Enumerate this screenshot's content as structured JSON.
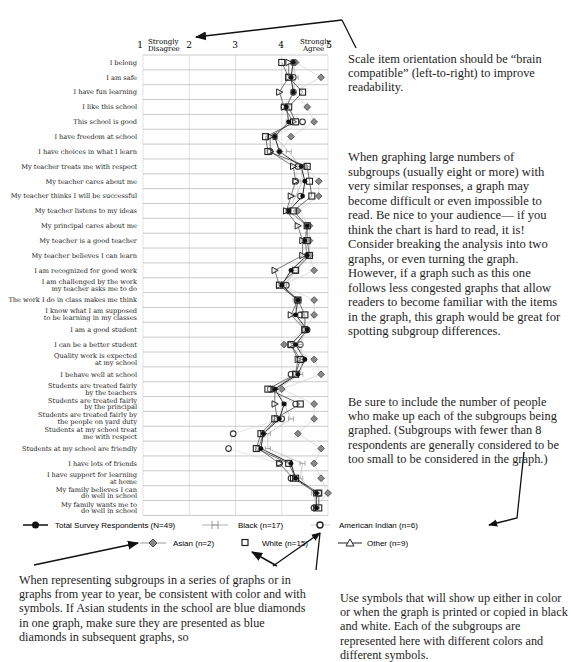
{
  "chart_data": {
    "type": "scatter",
    "title": "",
    "xlabel": "",
    "ylabel": "",
    "xlim": [
      1,
      5
    ],
    "x_ticks": [
      "1",
      "2",
      "3",
      "4",
      "5"
    ],
    "x_tick_annotations": {
      "1": "Strongly Disagree",
      "5": "Strongly Agree"
    },
    "grid": true,
    "legend_position": "bottom",
    "categories": [
      "I belong",
      "I am safe",
      "I have fun learning",
      "I like this school",
      "This school is good",
      "I have freedom at school",
      "I have choices in what I learn",
      "My teacher treats me with respect",
      "My teacher cares about me",
      "My teacher thinks I will be successful",
      "My teacher listens to my ideas",
      "My principal cares about me",
      "My teacher is a good teacher",
      "My teacher believes I can learn",
      "I am recognized for good work",
      "I am challenged by the work my teacher asks me to do",
      "The work I do in class makes me think",
      "I know what I am supposed to be learning in my classes",
      "I am a good student",
      "I can be a better student",
      "Quality work is expected at my school",
      "I behave well at school",
      "Students are treated fairly by the teachers",
      "Students are treated fairly by the principal",
      "Students are treated fairly by the people on yard duty",
      "Students at my school treat me with respect",
      "Students at my school are friendly",
      "I have lots of friends",
      "I have support for learning at home",
      "My family believes I can do well in school",
      "My family wants me to do well in school"
    ],
    "series": [
      {
        "name": "Total Survey Respondents (N=49)",
        "marker": "filled-circle",
        "line": true,
        "color": "#111111",
        "values": [
          4.25,
          4.2,
          4.25,
          4.1,
          4.15,
          3.85,
          3.95,
          4.42,
          4.5,
          4.45,
          4.15,
          4.55,
          4.5,
          4.55,
          4.2,
          4.0,
          4.35,
          4.3,
          4.55,
          4.3,
          4.5,
          4.35,
          3.85,
          4.05,
          3.95,
          3.6,
          3.55,
          4.2,
          4.3,
          4.75,
          4.75
        ]
      },
      {
        "name": "Black (n=17)",
        "marker": "bowtie",
        "line": true,
        "color": "#aaaaaa",
        "values": [
          4.25,
          4.3,
          4.25,
          4.1,
          4.15,
          3.85,
          4.15,
          4.4,
          4.45,
          4.3,
          4.15,
          4.55,
          4.5,
          4.55,
          4.3,
          4.05,
          4.3,
          4.3,
          4.5,
          4.4,
          4.45,
          4.4,
          3.9,
          4.05,
          4.2,
          3.7,
          3.7,
          4.45,
          4.4,
          4.7,
          4.75
        ]
      },
      {
        "name": "American Indian (n=6)",
        "marker": "open-circle",
        "line": true,
        "color": "#333333",
        "values": [
          4.25,
          4.25,
          4.25,
          4.05,
          4.45,
          3.85,
          3.75,
          4.35,
          4.3,
          4.4,
          4.15,
          4.55,
          4.5,
          4.55,
          4.3,
          4.1,
          4.35,
          4.4,
          4.55,
          4.4,
          4.45,
          4.2,
          3.75,
          4.3,
          4.0,
          2.95,
          2.85,
          3.95,
          4.2,
          4.8,
          4.7
        ]
      },
      {
        "name": "Asian (n=2)",
        "marker": "diamond",
        "line": true,
        "color": "#888888",
        "values": [
          4.3,
          4.85,
          4.25,
          4.55,
          4.7,
          4.2,
          3.95,
          4.5,
          4.8,
          4.8,
          4.35,
          4.6,
          4.6,
          4.6,
          4.7,
          4.0,
          4.7,
          4.7,
          4.5,
          4.05,
          4.7,
          4.85,
          4.0,
          4.7,
          4.7,
          4.35,
          4.85,
          4.7,
          4.85,
          5.0,
          4.7
        ]
      },
      {
        "name": "White (n=15)",
        "marker": "open-square",
        "line": true,
        "color": "#222222",
        "values": [
          4.0,
          4.15,
          4.45,
          4.15,
          4.3,
          3.65,
          3.7,
          4.55,
          4.6,
          4.65,
          4.25,
          4.55,
          4.55,
          4.6,
          4.3,
          3.95,
          4.35,
          4.5,
          4.5,
          4.2,
          4.4,
          4.3,
          3.7,
          4.4,
          3.85,
          3.55,
          3.45,
          4.15,
          4.3,
          4.8,
          4.8
        ]
      },
      {
        "name": "Other (n=9)",
        "marker": "open-triangle",
        "line": true,
        "color": "#222222",
        "values": [
          4.15,
          4.15,
          3.95,
          4.05,
          4.25,
          3.75,
          3.75,
          4.25,
          4.3,
          4.2,
          4.1,
          4.35,
          4.45,
          4.45,
          3.85,
          3.95,
          4.35,
          4.2,
          4.5,
          4.2,
          4.35,
          4.3,
          3.85,
          3.85,
          3.9,
          3.6,
          3.5,
          3.95,
          4.25,
          4.75,
          4.75
        ]
      }
    ]
  },
  "axis": {
    "tick_1": "1",
    "tick_2": "2",
    "tick_3": "3",
    "tick_4": "4",
    "tick_5": "5",
    "left_anchor_line1": "Strongly",
    "left_anchor_line2": "Disagree",
    "right_anchor_line1": "Strongly",
    "right_anchor_line2": "Agree"
  },
  "row_labels": [
    [
      "I belong"
    ],
    [
      "I am safe"
    ],
    [
      "I have fun learning"
    ],
    [
      "I like this school"
    ],
    [
      "This school is good"
    ],
    [
      "I have freedom at school"
    ],
    [
      "I have choices in what I learn"
    ],
    [
      "My teacher treats me with respect"
    ],
    [
      "My teacher cares about me"
    ],
    [
      "My teacher thinks I will be successful"
    ],
    [
      "My teacher listens to my ideas"
    ],
    [
      "My principal cares about me"
    ],
    [
      "My teacher is a good teacher"
    ],
    [
      "My teacher believes I can learn"
    ],
    [
      "I am recognized for good work"
    ],
    [
      "I am challenged by the work",
      "my teacher asks me to do"
    ],
    [
      "The work I do in class makes me think"
    ],
    [
      "I know what I am supposed",
      "to be learning in my classes"
    ],
    [
      "I am a good student"
    ],
    [
      "I can be a better student"
    ],
    [
      "Quality work is expected",
      "at my school"
    ],
    [
      "I behave well at school"
    ],
    [
      "Students are treated fairly",
      "by the teachers"
    ],
    [
      "Students are treated fairly",
      "by the principal"
    ],
    [
      "Students are treated fairly by",
      "the people on yard duty"
    ],
    [
      "Students at my school treat",
      "me with respect"
    ],
    [
      "Students at my school are friendly"
    ],
    [
      "I have lots of friends"
    ],
    [
      "I have support for learning",
      "at home"
    ],
    [
      "My family believes I can",
      "do well in school"
    ],
    [
      "My family wants me to",
      "do well in school"
    ]
  ],
  "legend": {
    "total": "Total Survey Respondents (N=49)",
    "black": "Black (n=17)",
    "american_indian": "American Indian (n=6)",
    "asian": "Asian (n=2)",
    "white": "White (n=15)",
    "other": "Other (n=9)"
  },
  "notes": {
    "scale_orientation": "Scale item orientation should be “brain compatible” (left-to-right) to improve readability.",
    "large_subgroups": "When graphing large numbers of subgroups (usually eight or more) with very similar responses, a graph may become difficult or even impossible to read. Be nice to your audience— if you think the chart is hard to read, it is! Consider breaking the analysis into two graphs, or even turning the graph. However, if a graph such as this one follows less congested graphs that allow readers to become familiar with the items in the graph, this graph would be great for spotting subgroup differences.",
    "include_n": "Be sure to include the number of people who make up each of the subgroups being graphed. (Subgroups with fewer than 8 respondents are generally considered to be too small to be considered in the graph.)",
    "consistency": "When representing subgroups in a series of graphs or in graphs from year to year, be consistent with color and with symbols. If Asian students in the school are blue diamonds in one graph, make sure they are presented as blue diamonds in subsequent graphs, so",
    "symbols": "Use symbols that will show up either in color or when the graph is printed or copied in black and white. Each of the subgroups are represented here with different colors and different symbols."
  }
}
